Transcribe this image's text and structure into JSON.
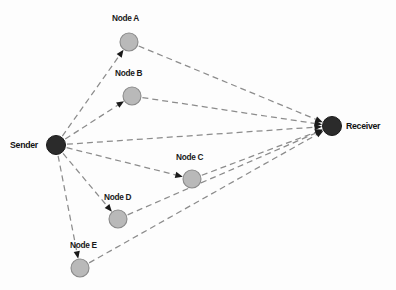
{
  "diagram": {
    "type": "network-routing-diagram",
    "background_color": "#fdfdfd",
    "colors": {
      "endpoint_fill": "#2b2b2b",
      "endpoint_stroke": "#1a1a1a",
      "relay_fill": "#b9b9b9",
      "relay_stroke": "#8a8a8a",
      "edge_color": "#8c8c8c",
      "arrow_color": "#1a1a1a",
      "label_color": "#1a1a1a"
    },
    "edge_style": "dashed",
    "nodes": [
      {
        "id": "sender",
        "label": "Sender",
        "kind": "endpoint",
        "x": 56,
        "y": 145,
        "r": 9.5,
        "label_x": 10,
        "label_y": 139
      },
      {
        "id": "node-a",
        "label": "Node A",
        "kind": "relay",
        "x": 129,
        "y": 42,
        "r": 9,
        "label_x": 112,
        "label_y": 13
      },
      {
        "id": "node-b",
        "label": "Node B",
        "kind": "relay",
        "x": 132,
        "y": 96,
        "r": 9,
        "label_x": 115,
        "label_y": 68
      },
      {
        "id": "node-c",
        "label": "Node C",
        "kind": "relay",
        "x": 192,
        "y": 179,
        "r": 9,
        "label_x": 176,
        "label_y": 152
      },
      {
        "id": "node-d",
        "label": "Node D",
        "kind": "relay",
        "x": 118,
        "y": 219,
        "r": 9,
        "label_x": 104,
        "label_y": 192
      },
      {
        "id": "node-e",
        "label": "Node E",
        "kind": "relay",
        "x": 80,
        "y": 268,
        "r": 9,
        "label_x": 70,
        "label_y": 240
      },
      {
        "id": "receiver",
        "label": "Receiver",
        "kind": "endpoint",
        "x": 332,
        "y": 126,
        "r": 9.5,
        "label_x": 346,
        "label_y": 120
      }
    ],
    "edges": [
      {
        "id": "sender-to-node-a",
        "from": "sender",
        "to": "node-a",
        "arrow": true
      },
      {
        "id": "sender-to-node-b",
        "from": "sender",
        "to": "node-b",
        "arrow": true
      },
      {
        "id": "sender-to-node-c",
        "from": "sender",
        "to": "node-c",
        "arrow": true
      },
      {
        "id": "sender-to-node-d",
        "from": "sender",
        "to": "node-d",
        "arrow": true
      },
      {
        "id": "sender-to-node-e",
        "from": "sender",
        "to": "node-e",
        "arrow": true
      },
      {
        "id": "sender-to-receiver",
        "from": "sender",
        "to": "receiver",
        "arrow": true
      },
      {
        "id": "node-a-to-receiver",
        "from": "node-a",
        "to": "receiver",
        "arrow": true
      },
      {
        "id": "node-b-to-receiver",
        "from": "node-b",
        "to": "receiver",
        "arrow": true
      },
      {
        "id": "node-c-to-receiver",
        "from": "node-c",
        "to": "receiver",
        "arrow": true
      },
      {
        "id": "node-d-to-receiver",
        "from": "node-d",
        "to": "receiver",
        "arrow": true
      },
      {
        "id": "node-e-to-receiver",
        "from": "node-e",
        "to": "receiver",
        "arrow": true
      }
    ]
  }
}
